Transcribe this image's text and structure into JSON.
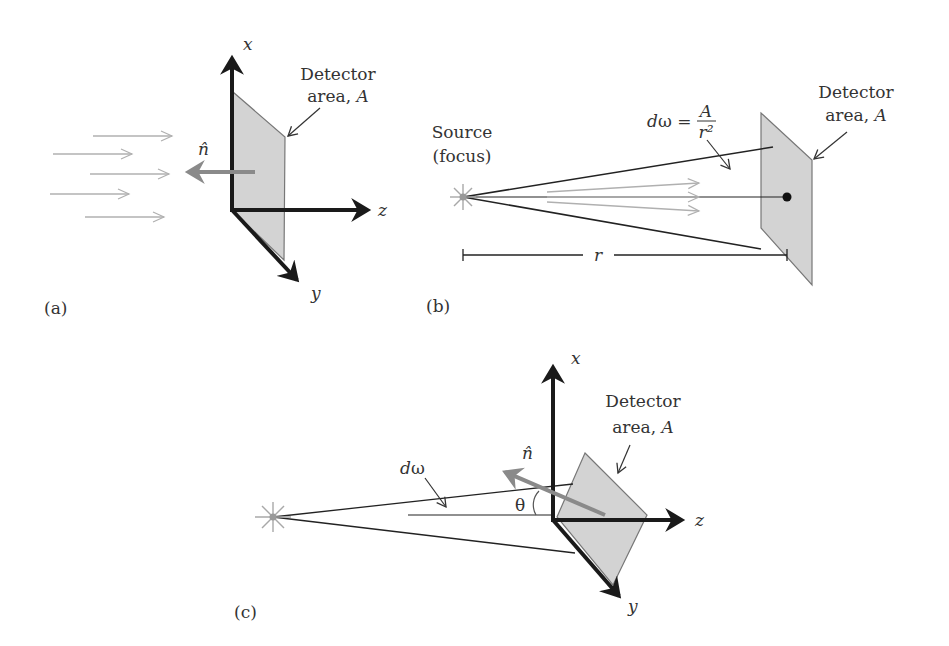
{
  "figure": {
    "panels": [
      {
        "id": "a",
        "label": "(a)",
        "axes": {
          "x": "x",
          "y": "y",
          "z": "z"
        },
        "detector_label_line1": "Detector",
        "detector_label_line2": "area, ",
        "detector_label_var": "A",
        "normal_label": "n̂",
        "incoming_rays": 5
      },
      {
        "id": "b",
        "label": "(b)",
        "source_label_line1": "Source",
        "source_label_line2": "(focus)",
        "solid_angle_lhs": "dω = ",
        "solid_angle_num": "A",
        "solid_angle_den": "r²",
        "distance_label": "r",
        "detector_label_line1": "Detector",
        "detector_label_line2": "area, ",
        "detector_label_var": "A"
      },
      {
        "id": "c",
        "label": "(c)",
        "axes": {
          "x": "x",
          "y": "y",
          "z": "z"
        },
        "solid_angle_label": "dω",
        "angle_label": "θ",
        "normal_label": "n̂",
        "detector_label_line1": "Detector",
        "detector_label_line2": "area, ",
        "detector_label_var": "A"
      }
    ],
    "colors": {
      "axis": "#1a1a1a",
      "detector_fill": "#d3d3d3",
      "detector_edge": "#777777",
      "normal_arrow": "#8a8a8a",
      "rays": "#b0b0b0",
      "text": "#333333"
    }
  }
}
